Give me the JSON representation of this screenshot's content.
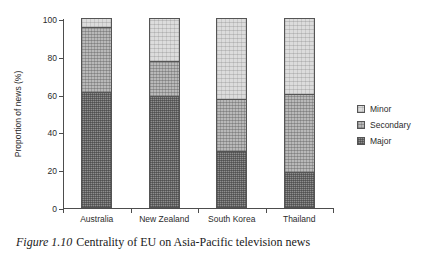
{
  "caption": {
    "figure_number": "Figure 1.10",
    "text": "Centrality of EU on Asia-Pacific television news"
  },
  "legend": {
    "position": "right",
    "items": [
      {
        "label": "Minor",
        "color": "#dcdcdc"
      },
      {
        "label": "Secondary",
        "color": "#b9b9b9"
      },
      {
        "label": "Major",
        "color": "#8e8e8e"
      }
    ]
  },
  "chart_data": {
    "type": "bar",
    "stacked": true,
    "title": "",
    "xlabel": "",
    "ylabel": "Proportion of news (%)",
    "ylim": [
      0,
      100
    ],
    "yticks": [
      0,
      20,
      40,
      60,
      80,
      100
    ],
    "ytick_labels": [
      "0",
      "20",
      "40",
      "60",
      "80",
      "100"
    ],
    "grid": false,
    "categories": [
      "Australia",
      "New Zealand",
      "South Korea",
      "Thailand"
    ],
    "series": [
      {
        "name": "Major",
        "color": "#8e8e8e",
        "values": [
          61,
          59,
          29.5,
          18.5
        ]
      },
      {
        "name": "Secondary",
        "color": "#b9b9b9",
        "values": [
          34,
          18,
          27.5,
          41.5
        ]
      },
      {
        "name": "Minor",
        "color": "#dcdcdc",
        "values": [
          5,
          23,
          43,
          40
        ]
      }
    ],
    "cumulative_tops": {
      "Major": [
        61,
        59,
        29.5,
        18.5
      ],
      "Secondary": [
        95,
        77,
        57,
        60
      ],
      "Minor": [
        100,
        100,
        100,
        100
      ]
    }
  }
}
